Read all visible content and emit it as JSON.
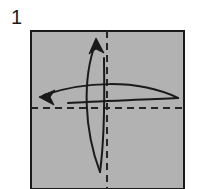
{
  "figure": {
    "kind": "origami-step-diagram",
    "step_number": "1",
    "canvas": {
      "width": 201,
      "height": 189
    },
    "background_color": "#ffffff"
  },
  "paper": {
    "label": "square sheet of paper",
    "fill_color": "#b2b2b2",
    "stroke_color": "#1a1a1a",
    "stroke_width": 2,
    "x": 31,
    "y": 31,
    "width": 153,
    "height": 158
  },
  "crease_lines": [
    {
      "name": "vertical-center-crease",
      "orientation": "vertical",
      "style": "dashed",
      "color": "#262626",
      "stroke_width": 1.6,
      "dash_pattern": "7 5",
      "x1": 107,
      "y1": 31,
      "x2": 107,
      "y2": 189
    },
    {
      "name": "horizontal-center-crease",
      "orientation": "horizontal",
      "style": "dashed",
      "color": "#262626",
      "stroke_width": 1.6,
      "dash_pattern": "7 5",
      "x1": 31,
      "y1": 108,
      "x2": 184,
      "y2": 108
    }
  ],
  "fold_arrows": [
    {
      "name": "upward-fold-arrow",
      "direction": "up",
      "color": "#1a1a1a",
      "stroke_width": 2,
      "description": "lens shaped valley fold arrow pointing toward the top edge",
      "outer_curve": "M 100 172 C 84 130, 82 78, 96 42",
      "inner_curve": "M 100 172 C 106 128, 104 84, 104 58",
      "head": "M 96 38 L 90 53 L 96 48 L 103 52 Z"
    },
    {
      "name": "leftward-fold-arrow",
      "direction": "left",
      "color": "#1a1a1a",
      "stroke_width": 2,
      "description": "lens shaped valley fold arrow pointing toward the left edge",
      "outer_curve": "M 178 98 C 136 78, 82 82, 44 95",
      "inner_curve": "M 178 98 C 140 100, 96 101, 68 103",
      "head": "M 39 97 L 54 91 L 49 97 L 53 104 Z"
    }
  ]
}
